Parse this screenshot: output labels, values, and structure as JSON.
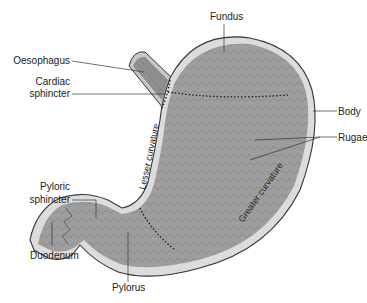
{
  "diagram": {
    "labels": {
      "fundus": "Fundus",
      "oesophagus": "Oesophagus",
      "cardiac_sphincter_1": "Cardiac",
      "cardiac_sphincter_2": "sphincter",
      "body": "Body",
      "rugae": "Rugae",
      "pyloric_sphincter_1": "Pyloric",
      "pyloric_sphincter_2": "sphincter",
      "lesser_curvature": "Lesser curvature",
      "greater_curvature": "Greater curvature",
      "duodenum": "Duodenum",
      "pylorus": "Pylorus"
    },
    "colors": {
      "tissue": "#9e9e9e",
      "tissue_dark": "#7d7d7d",
      "wall": "#d6d6d6",
      "outline": "#333333",
      "leader": "#333333"
    }
  }
}
